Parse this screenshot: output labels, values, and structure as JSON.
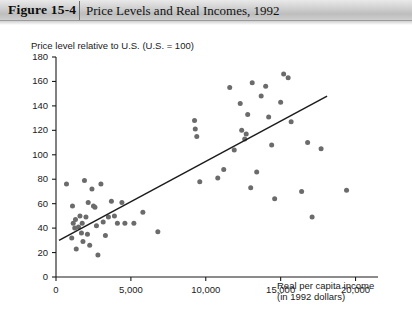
{
  "header": {
    "figure_number": "Figure 15-4",
    "title": "Price Levels and Real Incomes, 1992"
  },
  "chart_data": {
    "type": "scatter",
    "title": "Price Levels and Real Incomes, 1992",
    "xlabel": "Real per capita income",
    "xlabel_sub": "(in 1992 dollars)",
    "ylabel": "Price level relative to U.S. (U.S. = 100)",
    "xlim": [
      0,
      21500
    ],
    "ylim": [
      0,
      180
    ],
    "grid": false,
    "legend": null,
    "xticks": [
      0,
      5000,
      10000,
      15000,
      20000
    ],
    "xtick_labels": [
      "0",
      "5,000",
      "10,000",
      "15,000",
      "20,000"
    ],
    "yticks": [
      0,
      20,
      40,
      60,
      80,
      100,
      120,
      140,
      160,
      180
    ],
    "ytick_labels": [
      "0",
      "20",
      "40",
      "60",
      "80",
      "100",
      "120",
      "140",
      "160",
      "180"
    ],
    "marker_color": "#6b6b6b",
    "marker_size": 5,
    "line_color": "#1c1c1c",
    "points": [
      [
        700,
        76
      ],
      [
        1050,
        32
      ],
      [
        1100,
        58
      ],
      [
        1150,
        44
      ],
      [
        1250,
        40
      ],
      [
        1300,
        47
      ],
      [
        1350,
        23
      ],
      [
        1500,
        41
      ],
      [
        1600,
        50
      ],
      [
        1700,
        36
      ],
      [
        1750,
        44
      ],
      [
        1800,
        29
      ],
      [
        1900,
        79
      ],
      [
        2000,
        49
      ],
      [
        2100,
        35
      ],
      [
        2150,
        61
      ],
      [
        2250,
        26
      ],
      [
        2400,
        72
      ],
      [
        2500,
        58
      ],
      [
        2600,
        57
      ],
      [
        2700,
        42
      ],
      [
        2800,
        18
      ],
      [
        3000,
        76
      ],
      [
        3150,
        45
      ],
      [
        3300,
        34
      ],
      [
        3500,
        49
      ],
      [
        3700,
        62
      ],
      [
        3900,
        50
      ],
      [
        4100,
        44
      ],
      [
        4400,
        61
      ],
      [
        4600,
        44
      ],
      [
        5200,
        44
      ],
      [
        5800,
        53
      ],
      [
        6800,
        37
      ],
      [
        9250,
        128
      ],
      [
        9300,
        121
      ],
      [
        9400,
        115
      ],
      [
        9600,
        78
      ],
      [
        10800,
        81
      ],
      [
        11200,
        88
      ],
      [
        11600,
        155
      ],
      [
        11900,
        104
      ],
      [
        12300,
        142
      ],
      [
        12400,
        120
      ],
      [
        12600,
        113
      ],
      [
        12700,
        117
      ],
      [
        12800,
        133
      ],
      [
        13000,
        73
      ],
      [
        13100,
        159
      ],
      [
        13400,
        86
      ],
      [
        13700,
        148
      ],
      [
        14000,
        156
      ],
      [
        14200,
        131
      ],
      [
        14400,
        108
      ],
      [
        14600,
        64
      ],
      [
        15000,
        143
      ],
      [
        15200,
        166
      ],
      [
        15500,
        163
      ],
      [
        15700,
        127
      ],
      [
        16400,
        70
      ],
      [
        16800,
        110
      ],
      [
        17100,
        49
      ],
      [
        17700,
        105
      ],
      [
        19400,
        71
      ]
    ],
    "trend_line": {
      "x1": 200,
      "y1": 30,
      "x2": 18100,
      "y2": 148
    }
  }
}
